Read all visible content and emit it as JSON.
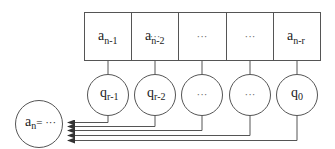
{
  "diagram": {
    "type": "linear-recurrence-feedback",
    "colors": {
      "stroke": "#555555",
      "text": "#222222",
      "background": "#ffffff"
    },
    "register_cells": [
      {
        "base": "a",
        "sub": "n-1"
      },
      {
        "base": "a",
        "sub": "n-2"
      },
      {
        "base": "",
        "sub": "",
        "ellipsis": "···"
      },
      {
        "base": "",
        "sub": "",
        "ellipsis": "···"
      },
      {
        "base": "a",
        "sub": "n-r"
      }
    ],
    "coefficient_nodes": [
      {
        "base": "q",
        "sub": "r-1"
      },
      {
        "base": "q",
        "sub": "r-2"
      },
      {
        "base": "",
        "sub": "",
        "ellipsis": "···"
      },
      {
        "base": "",
        "sub": "",
        "ellipsis": "···"
      },
      {
        "base": "q",
        "sub": "0"
      }
    ],
    "result_node": {
      "base": "a",
      "sub": "n",
      "rhs": "= ···"
    },
    "arrows": {
      "count": 5,
      "direction": "left",
      "target": "result_node"
    }
  }
}
